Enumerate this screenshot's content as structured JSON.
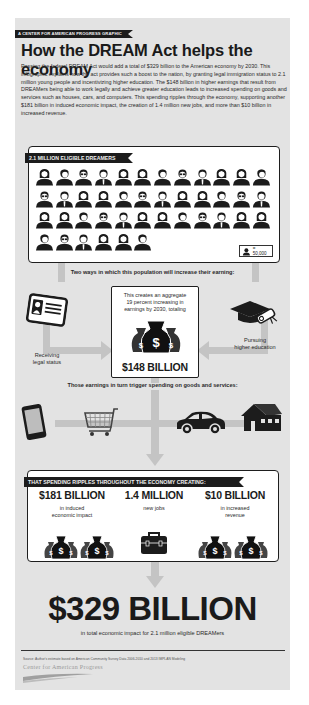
{
  "header": {
    "ribbon": "A Center for American Progress Graphic",
    "title": "How the DREAM Act helps the economy",
    "intro": "Passing the federal DREAM Act would add a total of $329 billion to the American economy by 2030. This infographic explains how the act provides such a boost to the nation, by granting legal immigration status to 2.1 million young people and incentivizing higher education. The $148 billion in higher earnings that result from DREAMers being able to work legally and achieve greater education leads to increased spending on goods and services such as houses, cars, and computers. This spending ripples through the economy, supporting another $181 billion in induced economic impact, the creation of 1.4 million new jobs, and more than $10 billion in increased revenue."
  },
  "dreamers": {
    "ribbon": "2.1 Million Eligible Dreamers",
    "icon_count": 42,
    "rows": [
      12,
      12,
      12,
      6
    ],
    "legend_value": "= 50,000",
    "legend_icon": "person-icon"
  },
  "ways": {
    "heading": "Two ways in which this population will increase their earning:",
    "left": {
      "icon": "id-card-icon",
      "label_line1": "Receiving",
      "label_line2": "legal status"
    },
    "right": {
      "icon": "graduation-cap-diploma-icon",
      "label_line1": "Pursuing",
      "label_line2": "higher education"
    },
    "center": {
      "text_line1": "This creates an aggregate",
      "text_line2": "19 percent increasing in",
      "text_line3": "earnings by 2030, totaling",
      "icon": "money-bags-icon",
      "total": "$148 BILLION"
    }
  },
  "spending": {
    "heading": "Those earnings in turn trigger spending on goods and services:",
    "icons": [
      "smartphone-icon",
      "shopping-cart-icon",
      "car-icon",
      "house-icon"
    ]
  },
  "ripples": {
    "ribbon": "That spending ripples throughout the economy creating:",
    "stats": [
      {
        "value": "$181 BILLION",
        "label_line1": "in induced",
        "label_line2": "economic impact",
        "icon": "money-bags-icon"
      },
      {
        "value": "1.4 MILLION",
        "label_line1": "new jobs",
        "label_line2": "",
        "icon": "briefcase-icon"
      },
      {
        "value": "$10 BILLION",
        "label_line1": "in increased",
        "label_line2": "revenue",
        "icon": "money-bags-icon"
      }
    ]
  },
  "total": {
    "value": "$329 BILLION",
    "caption": "in total economic impact for 2.1 million eligible DREAMers"
  },
  "footer": {
    "source": "Source: Author's estimate based on American Community Survey Data 2006-2010 and 2013 IMPLAN Modeling",
    "org": "Center for American Progress"
  },
  "colors": {
    "background": "#e3e3e3",
    "ink": "#1c1c1c",
    "pipe": "#c4c4c4",
    "panel": "#ffffff"
  }
}
